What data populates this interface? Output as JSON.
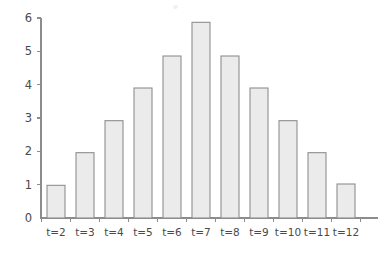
{
  "chart_data": {
    "type": "bar",
    "title": "",
    "subtitle": "",
    "xlabel": "",
    "ylabel": "",
    "categories": [
      "t=2",
      "t=3",
      "t=4",
      "t=5",
      "t=6",
      "t=7",
      "t=8",
      "t=9",
      "t=10",
      "t=11",
      "t=12"
    ],
    "values": [
      0.98,
      1.96,
      2.92,
      3.9,
      4.86,
      5.87,
      4.86,
      3.9,
      2.92,
      1.96,
      1.02
    ],
    "xlim": [
      0,
      11
    ],
    "ylim": [
      0,
      6
    ],
    "ytick_labels": [
      "0",
      "1",
      "2",
      "3",
      "4",
      "5",
      "6"
    ],
    "ytick_values": [
      0,
      1,
      2,
      3,
      4,
      5,
      6
    ],
    "grid": false,
    "legend": null,
    "legend_position": "none",
    "annotations": [],
    "series": [
      {
        "name": "frequency",
        "values": [
          0.98,
          1.96,
          2.92,
          3.9,
          4.86,
          5.87,
          4.86,
          3.9,
          2.92,
          1.96,
          1.02
        ]
      }
    ],
    "colors": {
      "bar_fill": "#ebebeb",
      "bar_stroke": "#8f8f8f",
      "axis": "#8c8c8c",
      "text": "#4a4a4a",
      "background": "#ffffff"
    }
  }
}
